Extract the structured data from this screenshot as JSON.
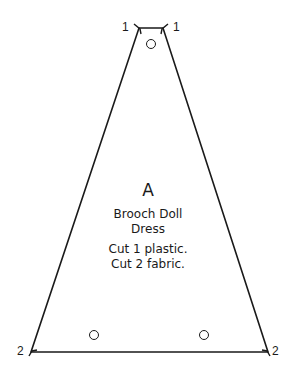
{
  "pattern": {
    "piece_letter": "A",
    "name_line1": "Brooch Doll",
    "name_line2": "Dress",
    "instruction1": "Cut 1 plastic.",
    "instruction2": "Cut 2 fabric."
  },
  "markers": {
    "top_left": "1",
    "top_right": "1",
    "bottom_left": "2",
    "bottom_right": "2"
  },
  "colors": {
    "line": "#1a1a1a",
    "background": "#ffffff"
  }
}
